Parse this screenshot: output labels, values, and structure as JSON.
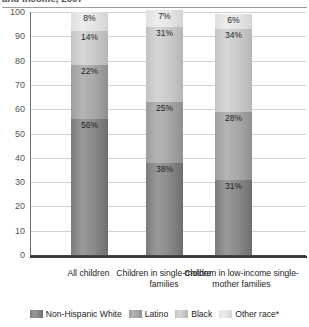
{
  "chart_data": {
    "type": "bar",
    "subtype": "stacked-bar-100",
    "title": "and income, 2007",
    "categories": [
      "All children",
      "Children in single-mother families",
      "Children in low-income single-mother families"
    ],
    "series": [
      {
        "name": "Non-Hispanic White",
        "color": "#8a8a8a",
        "values": [
          56,
          38,
          31
        ],
        "labels": [
          "56%",
          "38%",
          "31%"
        ]
      },
      {
        "name": "Latino",
        "color": "#a8a8a8",
        "values": [
          22,
          25,
          28
        ],
        "labels": [
          "22%",
          "25%",
          "28%"
        ]
      },
      {
        "name": "Black",
        "color": "#cbcbcb",
        "values": [
          14,
          31,
          34
        ],
        "labels": [
          "14%",
          "31%",
          "34%"
        ]
      },
      {
        "name": "Other race*",
        "color": "#e5e5e5",
        "values": [
          8,
          7,
          6
        ],
        "labels": [
          "8%",
          "7%",
          "6%"
        ]
      }
    ],
    "xlabel": "",
    "ylabel": "",
    "ylim": [
      0,
      100
    ],
    "yticks": [
      "0",
      "10",
      "20",
      "30",
      "40",
      "50",
      "60",
      "70",
      "80",
      "90",
      "100"
    ],
    "grid": true,
    "legend_position": "bottom"
  },
  "legend": {
    "items": [
      {
        "label": "Non-Hispanic White"
      },
      {
        "label": "Latino"
      },
      {
        "label": "Black"
      },
      {
        "label": "Other race*"
      }
    ]
  }
}
